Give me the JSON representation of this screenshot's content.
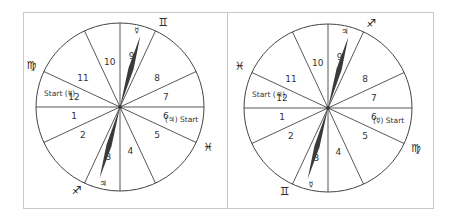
{
  "wheels": [
    {
      "id": "left",
      "sectors": [
        "1",
        "2",
        "3",
        "4",
        "5",
        "6",
        "7",
        "8",
        "9",
        "10",
        "11",
        "12"
      ],
      "start_left_label": "Start (☿)",
      "start_right_label": "(♃) Start",
      "needle_top_planet": "☿",
      "needle_bottom_planet": "♃",
      "sign_top_right": "♊",
      "sign_upper_left": "♍",
      "sign_lower_right": "♓",
      "sign_bottom_left": "♐"
    },
    {
      "id": "right",
      "sectors": [
        "1",
        "2",
        "3",
        "4",
        "5",
        "6",
        "7",
        "8",
        "9",
        "10",
        "11",
        "12"
      ],
      "start_left_label": "Start (♃)",
      "start_right_label": "(☿) Start",
      "needle_top_planet": "♃",
      "needle_bottom_planet": "☿",
      "sign_top_right": "♐",
      "sign_upper_left": "♓",
      "sign_lower_right": "♍",
      "sign_bottom_left": "♊"
    }
  ],
  "colors": {
    "line": "#444444",
    "needle": "#3a3a3a",
    "frame": "#c8c8c8"
  }
}
